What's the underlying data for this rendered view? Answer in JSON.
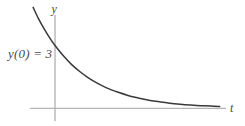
{
  "figure": {
    "background_color": "#ffffff",
    "axis_color": "#b5b5b5",
    "curve_color": "#3a3a3a",
    "label_color": "#4a4a4a",
    "labels": {
      "y_axis": "y",
      "t_axis": "t",
      "initial_value": "y(0) = 3"
    }
  },
  "chart_data": {
    "type": "line",
    "title": "",
    "xlabel": "t",
    "ylabel": "y",
    "grid": false,
    "legend": null,
    "annotations": [
      {
        "text": "y(0) = 3",
        "x": 0,
        "y": 3,
        "description": "initial condition label at the y-intercept of the curve"
      }
    ],
    "axis_style": "single horizontal t-axis and single vertical y-axis crossing at origin, no tick marks, no tick labels",
    "xlim": [
      -1.2,
      8.2
    ],
    "ylim": [
      -0.6,
      4.6
    ],
    "series": [
      {
        "name": "y(t) = 3e^{-0.45t}",
        "description": "exponential decay curve starting above the y-axis at the left, passing through (0, 3), decaying asymptotically toward y = 0",
        "x": [
          -1.05,
          -0.8,
          -0.5,
          -0.2,
          0.0,
          0.4,
          0.8,
          1.2,
          1.6,
          2.0,
          2.5,
          3.0,
          3.5,
          4.0,
          4.5,
          5.0,
          5.5,
          6.0,
          6.5,
          7.0,
          7.5,
          7.9
        ],
        "y": [
          4.82,
          4.3,
          3.76,
          3.28,
          3.0,
          2.51,
          2.09,
          1.75,
          1.46,
          1.22,
          0.97,
          0.78,
          0.62,
          0.5,
          0.39,
          0.32,
          0.25,
          0.2,
          0.16,
          0.13,
          0.11,
          0.09
        ]
      }
    ]
  }
}
